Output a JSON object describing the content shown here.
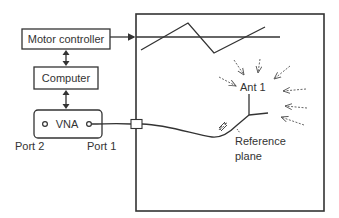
{
  "diagram": {
    "blocks": {
      "motor_controller": "Motor controller",
      "computer": "Computer",
      "vna": "VNA"
    },
    "ports": {
      "port2": "Port 2",
      "port1": "Port 1"
    },
    "antenna_label": "Ant 1",
    "reference_plane_line1": "Reference",
    "reference_plane_line2": "plane",
    "colors": {
      "stroke": "#333333",
      "background": "#ffffff"
    }
  }
}
